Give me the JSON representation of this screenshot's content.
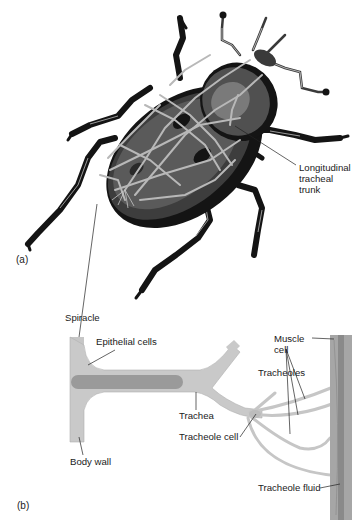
{
  "figure": {
    "panel_a": {
      "tag": "(a)",
      "labels": {
        "longitudinal_trunk": [
          "Longitudinal",
          "tracheal",
          "trunk"
        ]
      }
    },
    "panel_b": {
      "tag": "(b)",
      "labels": {
        "spiracle": "Spiracle",
        "epithelial_cells": "Epithelial cells",
        "body_wall": "Body wall",
        "trachea": "Trachea",
        "tracheole_cell": "Tracheole cell",
        "muscle_cell": [
          "Muscle",
          "cell"
        ],
        "tracheoles": "Tracheoles",
        "tracheole_fluid": "Tracheole fluid"
      }
    },
    "colors": {
      "beetle_dark": "#141414",
      "beetle_mid": "#4a4a4a",
      "beetle_light": "#6e6e6e",
      "trachea_light": "#bdbdbd",
      "tube_fill": "#c8c8c8",
      "tube_inner": "#9a9a9a",
      "muscle": "#a6a6a6",
      "muscle_dark": "#8a8a8a",
      "leader": "#222222"
    }
  }
}
